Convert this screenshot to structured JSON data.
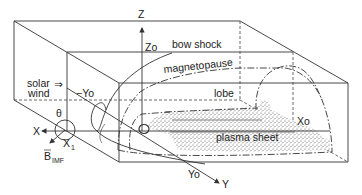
{
  "diagram": {
    "labels": {
      "z_axis": "Z",
      "z0": "Zo",
      "bow_shock": "bow shock",
      "magnetopause": "magnetopause",
      "solar_wind_line1": "solar",
      "solar_wind_line2": "wind",
      "solar_wind_arrow": "⇒",
      "minus_y0": "−Yo",
      "lobe": "lobe",
      "theta": "θ",
      "x_axis": "X",
      "x1": "X",
      "x1_sub": "1",
      "b_imf": "B",
      "b_imf_sub": "IMF",
      "plasma_sheet": "plasma sheet",
      "x0": "Xo",
      "y0": "Yo",
      "y_axis": "Y"
    },
    "colors": {
      "line": "#333333",
      "stipple": "#555555",
      "background": "#ffffff"
    }
  }
}
